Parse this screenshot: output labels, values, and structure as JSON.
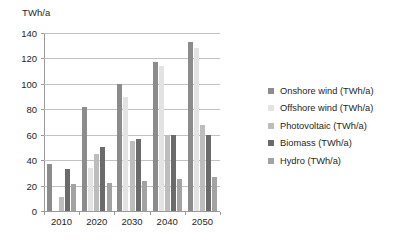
{
  "chart_data": {
    "type": "bar",
    "title": "",
    "ylabel": "TWh/a",
    "xlabel": "",
    "categories": [
      "2010",
      "2020",
      "2030",
      "2040",
      "2050"
    ],
    "ylim": [
      0,
      140
    ],
    "yticks": [
      0,
      20,
      40,
      60,
      80,
      100,
      120,
      140
    ],
    "grid": true,
    "legend_position": "right",
    "series": [
      {
        "name": "Onshore wind (TWh/a)",
        "color": "#8c8c8c",
        "values": [
          37,
          82,
          100,
          117,
          133
        ]
      },
      {
        "name": "Offshore wind (TWh/a)",
        "color": "#e3e3e3",
        "values": [
          0,
          34,
          90,
          114,
          128
        ]
      },
      {
        "name": "Photovoltaic (TWh/a)",
        "color": "#bdbdbd",
        "values": [
          11,
          45,
          55,
          60,
          68
        ]
      },
      {
        "name": "Biomass (TWh/a)",
        "color": "#6b6b6b",
        "values": [
          33,
          50,
          57,
          60,
          60
        ]
      },
      {
        "name": "Hydro (TWh/a)",
        "color": "#a3a3a3",
        "values": [
          21,
          22,
          24,
          25,
          27
        ]
      }
    ]
  }
}
